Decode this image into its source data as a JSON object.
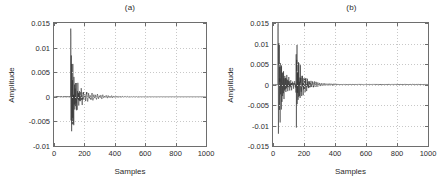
{
  "figure": {
    "background": "#ffffff",
    "axis_color": "#6e6e6e",
    "grid_color": "#c8c8c8",
    "trace_color": "#303030"
  },
  "chart_data": [
    {
      "type": "line",
      "title": "(a)",
      "xlabel": "Samples",
      "ylabel": "Amplitude",
      "xlim": [
        0,
        1000
      ],
      "ylim": [
        -0.01,
        0.015
      ],
      "xticks": [
        0,
        200,
        400,
        600,
        800,
        1000
      ],
      "xticklabels": [
        "0",
        "200",
        "400",
        "600",
        "800",
        "1000"
      ],
      "yticks": [
        -0.01,
        -0.005,
        0,
        0.005,
        0.01,
        0.015
      ],
      "yticklabels": [
        "-0.01",
        "-0.005",
        "0",
        "0.005",
        "0.01",
        "0.015"
      ],
      "grid": true,
      "legend": null,
      "series": [
        {
          "name": "signal-a",
          "description": "Single decaying transient burst starting near sample 110; sharp positive spike to 0.0123 and negative excursion to -0.007, then exponentially decaying oscillation to a flat tail near zero by sample 600.",
          "onset_sample": 110,
          "peak_positive": 0.0123,
          "peak_negative": -0.007,
          "envelope_decay_end": 620
        }
      ]
    },
    {
      "type": "line",
      "title": "(b)",
      "xlabel": "Samples",
      "ylabel": "Amplitude",
      "xlim": [
        0,
        1000
      ],
      "ylim": [
        -0.015,
        0.015
      ],
      "xticks": [
        0,
        200,
        400,
        600,
        800,
        1000
      ],
      "xticklabels": [
        "0",
        "200",
        "400",
        "600",
        "800",
        "1000"
      ],
      "yticks": [
        -0.015,
        -0.01,
        -0.005,
        0,
        0.005,
        0.01,
        0.015
      ],
      "yticklabels": [
        "-0.015",
        "-0.01",
        "-0.005",
        "0",
        "0.005",
        "0.01",
        "0.015"
      ],
      "grid": true,
      "legend": null,
      "series": [
        {
          "name": "signal-b",
          "description": "Two transient bursts: first near sample 40 reaching 0.015 and -0.012, second near sample 150 reaching 0.007 and -0.0105; oscillation decays to a flat tail near zero by sample 420.",
          "onset_sample": 30,
          "second_burst_sample": 150,
          "peak_positive": 0.015,
          "peak_negative": -0.012,
          "envelope_decay_end": 450
        }
      ]
    }
  ]
}
